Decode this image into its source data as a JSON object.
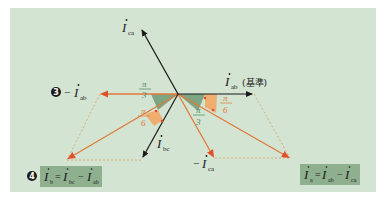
{
  "colors": {
    "background": "#ffffff",
    "panel": "#d3e4d3",
    "formula_box": "#8fb08f",
    "black_vector": "#1a1a1a",
    "orange_vector": "#e07a3a",
    "orange_arrowhead": "#e0502a",
    "green_angle_fill": "#6f9a72",
    "orange_angle_fill": "#f2a765",
    "dashed_line": "#d9a05a",
    "fraction_orange": "#e07a3a",
    "fraction_green": "#3f8a5a"
  },
  "vectors": {
    "i_ab": {
      "symbol": "I",
      "subscript": "ab",
      "note": "(基準)"
    },
    "i_ca": {
      "symbol": "I",
      "subscript": "ca"
    },
    "i_bc": {
      "symbol": "I",
      "subscript": "bc"
    },
    "neg_i_ab": {
      "prefix": "−",
      "symbol": "I",
      "subscript": "ab",
      "step": "❸"
    },
    "neg_i_ca": {
      "prefix": "−",
      "symbol": "I",
      "subscript": "ca"
    }
  },
  "angles": [
    {
      "label_num": "π",
      "label_den": "3",
      "color": "green",
      "position": "left-upper"
    },
    {
      "label_num": "π",
      "label_den": "6",
      "color": "orange",
      "position": "left-lower"
    },
    {
      "label_num": "π",
      "label_den": "3",
      "color": "green",
      "position": "right-lower"
    },
    {
      "label_num": "π",
      "label_den": "6",
      "color": "orange",
      "position": "right-upper"
    }
  ],
  "formulas": {
    "left": {
      "step": "❹",
      "lhs": "I",
      "lhs_sub": "b",
      "eq": "=",
      "t1": "I",
      "t1_sub": "bc",
      "op": "−",
      "t2": "I",
      "t2_sub": "ab"
    },
    "right": {
      "lhs": "I",
      "lhs_sub": "a",
      "eq": "=",
      "t1": "I",
      "t1_sub": "ab",
      "op": "−",
      "t2": "I",
      "t2_sub": "ca"
    }
  }
}
